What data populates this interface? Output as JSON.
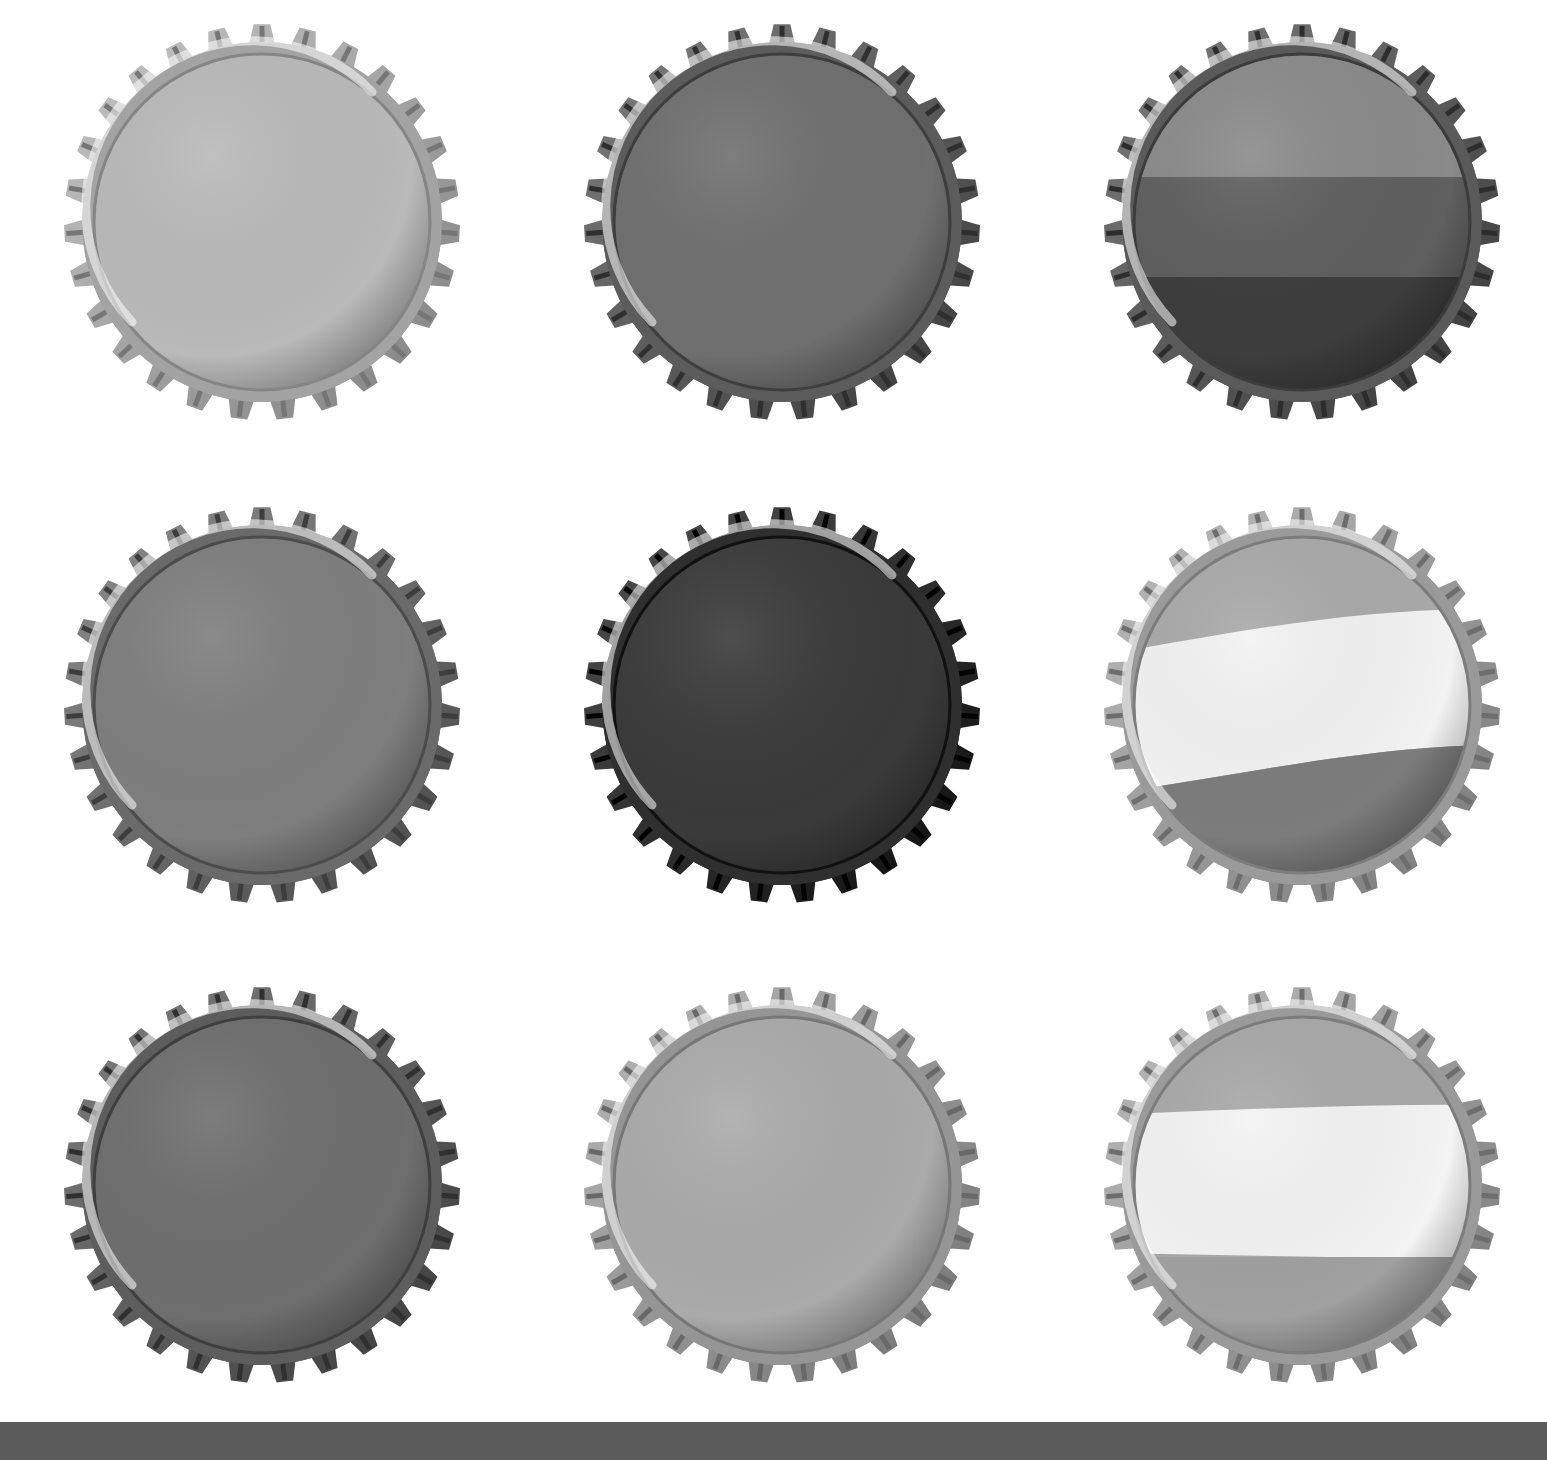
{
  "image": {
    "description": "Grid of nine crown bottle caps (grayscale)",
    "background": "#ffffff",
    "bottom_band_color": "#5a5a5a"
  },
  "caps": [
    {
      "id": "cap-1",
      "row": 1,
      "col": 1,
      "x": 62,
      "y": 22,
      "style": "solid",
      "colors": [
        "#b9b9b9"
      ],
      "rim": "#a3a3a3"
    },
    {
      "id": "cap-2",
      "row": 1,
      "col": 2,
      "x": 582,
      "y": 22,
      "style": "solid",
      "colors": [
        "#6f6f6f"
      ],
      "rim": "#5c5c5c"
    },
    {
      "id": "cap-3",
      "row": 1,
      "col": 3,
      "x": 1102,
      "y": 22,
      "style": "tricolor-horizontal",
      "colors": [
        "#8a8a8a",
        "#5f5f5f",
        "#3d3d3d"
      ],
      "rim": "#5a5a5a"
    },
    {
      "id": "cap-4",
      "row": 2,
      "col": 1,
      "x": 62,
      "y": 505,
      "style": "solid",
      "colors": [
        "#7e7e7e"
      ],
      "rim": "#6a6a6a"
    },
    {
      "id": "cap-5",
      "row": 2,
      "col": 2,
      "x": 582,
      "y": 505,
      "style": "solid",
      "colors": [
        "#3a3a3a"
      ],
      "rim": "#2f2f2f"
    },
    {
      "id": "cap-6",
      "row": 2,
      "col": 3,
      "x": 1102,
      "y": 505,
      "style": "wave-band",
      "colors": [
        "#a9a9a9",
        "#f2f2f2",
        "#7c7c7c"
      ],
      "rim": "#9a9a9a"
    },
    {
      "id": "cap-7",
      "row": 3,
      "col": 1,
      "x": 62,
      "y": 985,
      "style": "solid",
      "colors": [
        "#6e6e6e"
      ],
      "rim": "#5d5d5d"
    },
    {
      "id": "cap-8",
      "row": 3,
      "col": 2,
      "x": 582,
      "y": 985,
      "style": "solid",
      "colors": [
        "#aaaaaa"
      ],
      "rim": "#959595"
    },
    {
      "id": "cap-9",
      "row": 3,
      "col": 3,
      "x": 1102,
      "y": 985,
      "style": "straight-band",
      "colors": [
        "#a8a8a8",
        "#f3f3f3",
        "#a0a0a0"
      ],
      "rim": "#9a9a9a"
    }
  ]
}
